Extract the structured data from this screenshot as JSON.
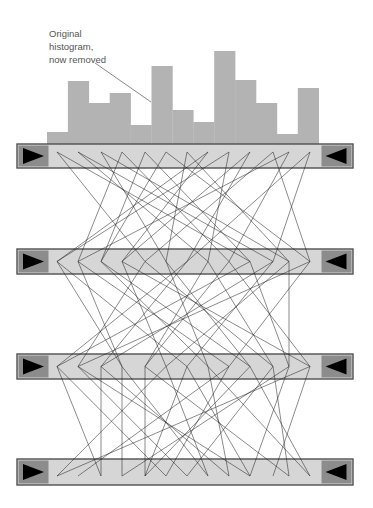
{
  "annotation": {
    "lines": [
      "Original",
      "histogram,",
      "now removed"
    ],
    "pointer": {
      "x1": 95,
      "y1": 63,
      "x2": 151,
      "y2": 102
    }
  },
  "colors": {
    "histogram": "#b3b3b3",
    "bar_fill": "#d6d6d6",
    "bar_border": "#505050",
    "arrow_box": "#8c8c8c",
    "arrow": "#000000",
    "line": "#1a1a1a"
  },
  "chart_data": {
    "type": "bar",
    "title": "Original histogram, now removed",
    "categories": [
      "1",
      "2",
      "3",
      "4",
      "5",
      "6",
      "7",
      "8",
      "9",
      "10",
      "11",
      "12",
      "13"
    ],
    "values": [
      12,
      63,
      41,
      51,
      19,
      78,
      34,
      22,
      93,
      64,
      41,
      10,
      56
    ],
    "xlabel": "",
    "ylabel": "",
    "grid": false,
    "baseline_y": 144,
    "x_start": 47,
    "bar_width": 20.9
  },
  "bars": [
    {
      "name": "bar-1",
      "y": 144,
      "h": 24
    },
    {
      "name": "bar-2",
      "y": 249,
      "h": 25
    },
    {
      "name": "bar-3",
      "y": 354,
      "h": 25
    },
    {
      "name": "bar-4",
      "y": 459,
      "h": 26
    }
  ],
  "bar_geometry": {
    "x": 17,
    "w": 336,
    "arrow_box_w": 30
  },
  "vertex_x": [
    57,
    78,
    101,
    122,
    145,
    166,
    187,
    208,
    229,
    250,
    273,
    289,
    310
  ],
  "connections": [
    [
      [
        0,
        4
      ],
      [
        1,
        7
      ],
      [
        2,
        5
      ],
      [
        3,
        1
      ],
      [
        4,
        9
      ],
      [
        5,
        2
      ],
      [
        6,
        11
      ],
      [
        7,
        3
      ],
      [
        8,
        0
      ],
      [
        9,
        6
      ],
      [
        10,
        12
      ],
      [
        11,
        8
      ],
      [
        12,
        10
      ],
      [
        0,
        9
      ],
      [
        2,
        11
      ],
      [
        4,
        2
      ],
      [
        6,
        5
      ],
      [
        8,
        7
      ],
      [
        10,
        4
      ],
      [
        12,
        6
      ],
      [
        1,
        10
      ],
      [
        3,
        8
      ],
      [
        5,
        12
      ],
      [
        7,
        0
      ],
      [
        9,
        3
      ],
      [
        11,
        1
      ]
    ],
    [
      [
        0,
        6
      ],
      [
        1,
        3
      ],
      [
        2,
        9
      ],
      [
        3,
        12
      ],
      [
        4,
        1
      ],
      [
        5,
        7
      ],
      [
        6,
        0
      ],
      [
        7,
        10
      ],
      [
        8,
        4
      ],
      [
        9,
        11
      ],
      [
        10,
        2
      ],
      [
        11,
        5
      ],
      [
        12,
        8
      ],
      [
        0,
        3
      ],
      [
        2,
        7
      ],
      [
        4,
        10
      ],
      [
        6,
        2
      ],
      [
        8,
        12
      ],
      [
        10,
        6
      ],
      [
        12,
        1
      ],
      [
        1,
        8
      ],
      [
        3,
        5
      ],
      [
        5,
        9
      ],
      [
        7,
        4
      ],
      [
        9,
        0
      ],
      [
        11,
        11
      ]
    ],
    [
      [
        0,
        5
      ],
      [
        1,
        9
      ],
      [
        2,
        2
      ],
      [
        3,
        7
      ],
      [
        4,
        11
      ],
      [
        5,
        0
      ],
      [
        6,
        4
      ],
      [
        7,
        8
      ],
      [
        8,
        1
      ],
      [
        9,
        12
      ],
      [
        10,
        6
      ],
      [
        11,
        3
      ],
      [
        12,
        10
      ],
      [
        0,
        2
      ],
      [
        2,
        8
      ],
      [
        4,
        4
      ],
      [
        6,
        9
      ],
      [
        8,
        5
      ],
      [
        10,
        11
      ],
      [
        12,
        0
      ],
      [
        1,
        6
      ],
      [
        3,
        3
      ],
      [
        5,
        7
      ],
      [
        7,
        12
      ],
      [
        9,
        4
      ],
      [
        11,
        9
      ]
    ]
  ]
}
